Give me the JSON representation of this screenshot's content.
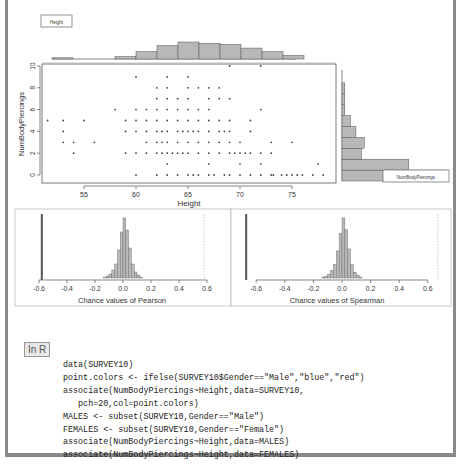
{
  "chart_data": [
    {
      "type": "scatter",
      "title": "",
      "xlabel": "Height",
      "ylabel": "NumBodyPiercings",
      "xlim": [
        50.5,
        78.7
      ],
      "ylim": [
        -0.3,
        10.3
      ],
      "xticks": [
        55,
        60,
        65,
        70,
        75
      ],
      "yticks": [
        0,
        2,
        4,
        6,
        8,
        10
      ],
      "legend": [
        "Height",
        "NumBodyPiercings"
      ],
      "points": [
        [
          51.5,
          5
        ],
        [
          53,
          5
        ],
        [
          53,
          4
        ],
        [
          53,
          3
        ],
        [
          54,
          3
        ],
        [
          54,
          2
        ],
        [
          55,
          5
        ],
        [
          56,
          3
        ],
        [
          58,
          6
        ],
        [
          59,
          5
        ],
        [
          59,
          4
        ],
        [
          59,
          2
        ],
        [
          60,
          9
        ],
        [
          60,
          6
        ],
        [
          60,
          5
        ],
        [
          60,
          4
        ],
        [
          60,
          2
        ],
        [
          60,
          0
        ],
        [
          61,
          6
        ],
        [
          61,
          5
        ],
        [
          61,
          4
        ],
        [
          61,
          3
        ],
        [
          61,
          2
        ],
        [
          62,
          8
        ],
        [
          62,
          7
        ],
        [
          62,
          6
        ],
        [
          62,
          5
        ],
        [
          62,
          4
        ],
        [
          62,
          3
        ],
        [
          62,
          2
        ],
        [
          62,
          0
        ],
        [
          62.5,
          4
        ],
        [
          62.5,
          3
        ],
        [
          62.5,
          2
        ],
        [
          63,
          9
        ],
        [
          63,
          8
        ],
        [
          63,
          7
        ],
        [
          63,
          6
        ],
        [
          63,
          5
        ],
        [
          63,
          4
        ],
        [
          63,
          3
        ],
        [
          63,
          2
        ],
        [
          63,
          1
        ],
        [
          63,
          0
        ],
        [
          63.5,
          2
        ],
        [
          64,
          7
        ],
        [
          64,
          6
        ],
        [
          64,
          5
        ],
        [
          64,
          4
        ],
        [
          64,
          3
        ],
        [
          64,
          2
        ],
        [
          64,
          0
        ],
        [
          64.5,
          4
        ],
        [
          64.5,
          2
        ],
        [
          65,
          9
        ],
        [
          65,
          8
        ],
        [
          65,
          7
        ],
        [
          65,
          6
        ],
        [
          65,
          5
        ],
        [
          65,
          4
        ],
        [
          65,
          3
        ],
        [
          65,
          2
        ],
        [
          65,
          0
        ],
        [
          65.5,
          4
        ],
        [
          65.5,
          0
        ],
        [
          66,
          8
        ],
        [
          66,
          6
        ],
        [
          66,
          5
        ],
        [
          66,
          4
        ],
        [
          66,
          3
        ],
        [
          66,
          2
        ],
        [
          66,
          0
        ],
        [
          67,
          8
        ],
        [
          67,
          7
        ],
        [
          67,
          6
        ],
        [
          67,
          5
        ],
        [
          67,
          4
        ],
        [
          67,
          3
        ],
        [
          67,
          2
        ],
        [
          67,
          1
        ],
        [
          67,
          0
        ],
        [
          67.5,
          0
        ],
        [
          68,
          8
        ],
        [
          68,
          7
        ],
        [
          68,
          5
        ],
        [
          68,
          4
        ],
        [
          68,
          3
        ],
        [
          68,
          2
        ],
        [
          68.5,
          4
        ],
        [
          68.5,
          0
        ],
        [
          69,
          10
        ],
        [
          69,
          7
        ],
        [
          69,
          5
        ],
        [
          69,
          4
        ],
        [
          69,
          3
        ],
        [
          69,
          2
        ],
        [
          69,
          0
        ],
        [
          69.5,
          2
        ],
        [
          70,
          3
        ],
        [
          70,
          2
        ],
        [
          70,
          1
        ],
        [
          70,
          0
        ],
        [
          70.5,
          2
        ],
        [
          71,
          5
        ],
        [
          71,
          4
        ],
        [
          71,
          2
        ],
        [
          71,
          0
        ],
        [
          72,
          10
        ],
        [
          72,
          6
        ],
        [
          72,
          2
        ],
        [
          72,
          1
        ],
        [
          72,
          0
        ],
        [
          73,
          3
        ],
        [
          73,
          2
        ],
        [
          73,
          0
        ],
        [
          73.2,
          0
        ],
        [
          74,
          0
        ],
        [
          74.5,
          0
        ],
        [
          75,
          3
        ],
        [
          75,
          0
        ],
        [
          75.5,
          0
        ],
        [
          76,
          0
        ],
        [
          77,
          0
        ],
        [
          77.5,
          1
        ],
        [
          78,
          0
        ]
      ],
      "marginal_x_histogram": {
        "bin_edges": [
          51,
          53,
          55,
          57,
          59,
          61,
          63,
          65,
          67,
          69,
          71,
          73,
          75,
          77,
          79
        ],
        "counts": [
          1,
          0,
          0,
          2,
          6,
          11,
          14,
          13,
          12,
          9,
          6,
          3,
          0,
          0
        ]
      },
      "marginal_y_histogram": {
        "bin_edges": [
          -0.5,
          0.5,
          1.5,
          2.5,
          3.5,
          4.5,
          5.5,
          6.5,
          7.5,
          8.5,
          9.5,
          10.5
        ],
        "counts": [
          37,
          24,
          7,
          8,
          5,
          3,
          1,
          1,
          1,
          0,
          0
        ]
      }
    },
    {
      "type": "bar",
      "title": "",
      "xlabel": "Chance values of Pearson",
      "ylabel": "",
      "xlim": [
        -0.6,
        0.6
      ],
      "xticks": [
        -0.6,
        -0.4,
        -0.2,
        0.0,
        0.2,
        0.4,
        0.6
      ],
      "observed_value": -0.58,
      "observed_mirror": 0.58,
      "bin_centers": [
        -0.13,
        -0.11,
        -0.09,
        -0.07,
        -0.05,
        -0.03,
        -0.01,
        0.01,
        0.03,
        0.05,
        0.07,
        0.09,
        0.11,
        0.13
      ],
      "values": [
        1,
        2,
        4,
        8,
        14,
        28,
        46,
        60,
        48,
        30,
        14,
        6,
        3,
        1
      ]
    },
    {
      "type": "bar",
      "title": "",
      "xlabel": "Chance values of Spearman",
      "ylabel": "",
      "xlim": [
        -0.6,
        0.6
      ],
      "xticks": [
        -0.6,
        -0.4,
        -0.2,
        0.0,
        0.2,
        0.4,
        0.6
      ],
      "observed_value": -0.67,
      "observed_mirror": 0.67,
      "bin_centers": [
        -0.13,
        -0.11,
        -0.09,
        -0.07,
        -0.05,
        -0.03,
        -0.01,
        0.01,
        0.03,
        0.05,
        0.07,
        0.09,
        0.11,
        0.13
      ],
      "values": [
        1,
        2,
        4,
        8,
        14,
        28,
        46,
        62,
        50,
        30,
        14,
        6,
        3,
        1
      ]
    }
  ],
  "scatter": {
    "xlabel": "Height",
    "ylabel": "NumBodyPiercings",
    "xtick_labels": [
      "55",
      "60",
      "65",
      "70",
      "75"
    ],
    "ytick_labels": [
      "0",
      "2",
      "4",
      "6",
      "8",
      "10"
    ],
    "legend_x": "Height",
    "legend_y": "NumBodyPiercings"
  },
  "pearson": {
    "xlabel": "Chance values of Pearson",
    "tick_labels": [
      "-0.6",
      "-0.4",
      "-0.2",
      "0.0",
      "0.2",
      "0.4",
      "0.6"
    ]
  },
  "spearman": {
    "xlabel": "Chance values of Spearman",
    "tick_labels": [
      "-0.6",
      "-0.4",
      "-0.2",
      "0.0",
      "0.2",
      "0.4",
      "0.6"
    ]
  },
  "code_block": {
    "label": "In R",
    "lines": [
      "data(SURVEY10)",
      "point.colors <- ifelse(SURVEY10$Gender==\"Male\",\"blue\",\"red\")",
      "associate(NumBodyPiercings~Height,data=SURVEY10,",
      "   pch=20,col=point.colors)",
      "MALES <- subset(SURVEY10,Gender==\"Male\")",
      "FEMALES <- subset(SURVEY10,Gender==\"Female\")",
      "associate(NumBodyPiercings~Height,data=MALES)",
      "associate(NumBodyPiercings~Height,data=FEMALES)"
    ]
  },
  "colors": {
    "bar_fill": "#b8b8b8",
    "axis": "#555555",
    "frame": "#8a8a8a",
    "point": "#444444"
  }
}
